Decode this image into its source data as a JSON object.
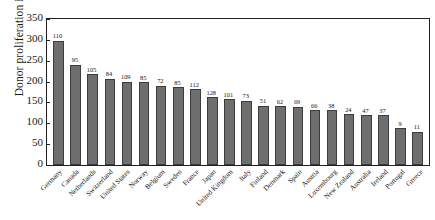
{
  "chart_data": {
    "type": "bar",
    "title": "",
    "xlabel": "",
    "ylabel": "Donor proliferation index",
    "ylim": [
      0,
      350
    ],
    "yticks": [
      0,
      50,
      100,
      150,
      200,
      250,
      300,
      350
    ],
    "grid": false,
    "legend": null,
    "categories": [
      "Germany",
      "Canada",
      "Netherlands",
      "Switzerland",
      "United States",
      "Norway",
      "Belgium",
      "Sweden",
      "France",
      "Japan",
      "United Kingdom",
      "Italy",
      "Finland",
      "Denmark",
      "Spain",
      "Austria",
      "Luxembourg",
      "New Zealand",
      "Australia",
      "Ireland",
      "Portugal",
      "Greece"
    ],
    "values": [
      298,
      240,
      218,
      207,
      200,
      199,
      190,
      186,
      182,
      163,
      158,
      154,
      142,
      141,
      140,
      131,
      131,
      122,
      120,
      119,
      88,
      80
    ],
    "point_labels": [
      "110",
      "95",
      "105",
      "84",
      "109",
      "85",
      "72",
      "85",
      "112",
      "128",
      "101",
      "73",
      "51",
      "62",
      "69",
      "66",
      "38",
      "24",
      "47",
      "37",
      "9",
      "11"
    ],
    "bar_color": "#6e6e6e",
    "bar_edge_color": "#3c3c3c",
    "axis_color": "#231f20"
  }
}
